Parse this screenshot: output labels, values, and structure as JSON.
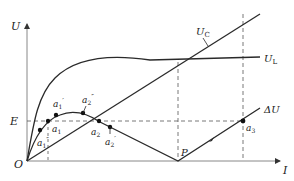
{
  "diagram": {
    "type": "voltage-current characteristic",
    "axes": {
      "y_label": "U",
      "x_label": "I",
      "origin_label": "O"
    },
    "reference_line": {
      "label": "E"
    },
    "curves": [
      {
        "id": "UC",
        "label": "U",
        "subscript": "C",
        "kind": "straight line through origin"
      },
      {
        "id": "UL",
        "label": "U",
        "subscript": "L",
        "kind": "saturating curve"
      },
      {
        "id": "dU",
        "label": "ΔU",
        "kind": "difference curve (|UL − UC|)"
      }
    ],
    "points": [
      {
        "id": "a1",
        "label": "a",
        "subscript": "1",
        "prime": ""
      },
      {
        "id": "a1p",
        "label": "a",
        "subscript": "1",
        "prime": "′"
      },
      {
        "id": "a1pp",
        "label": "a",
        "subscript": "1",
        "prime": "″"
      },
      {
        "id": "a2",
        "label": "a",
        "subscript": "2",
        "prime": ""
      },
      {
        "id": "a2p",
        "label": "a",
        "subscript": "2",
        "prime": "′"
      },
      {
        "id": "a2pp",
        "label": "a",
        "subscript": "2",
        "prime": "″"
      },
      {
        "id": "a3",
        "label": "a",
        "subscript": "3",
        "prime": ""
      },
      {
        "id": "P",
        "label": "P",
        "subscript": "",
        "prime": ""
      }
    ],
    "colors": {
      "line": "#2a2a2a",
      "axis": "#888888",
      "dashed": "#555555"
    }
  }
}
